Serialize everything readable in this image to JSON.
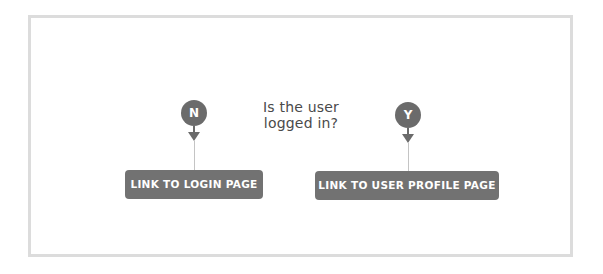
{
  "diagram": {
    "question": {
      "line1": "Is the user",
      "line2": "logged in?"
    },
    "branches": [
      {
        "marker": "N",
        "meaning": "no",
        "action_label": "LINK TO LOGIN PAGE"
      },
      {
        "marker": "Y",
        "meaning": "yes",
        "action_label": "LINK TO USER PROFILE PAGE"
      }
    ],
    "colors": {
      "frame_border": "#dcdcdc",
      "marker_fill": "#6b6b6b",
      "connector_line": "#c4c4c4",
      "action_fill": "#727272",
      "action_text": "#ffffff",
      "question_text": "#4a4a4a"
    }
  }
}
